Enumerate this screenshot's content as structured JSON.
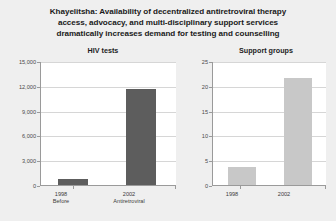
{
  "title": {
    "line1": "Khayelitsha: Availability of decentralized antiretroviral therapy",
    "line2": "access, advocacy, and multi-disciplinary support services",
    "line3": "dramatically increases demand for testing and counselling"
  },
  "colors": {
    "background": "#efefef",
    "plot_background": "#ffffff",
    "gridline": "#d6d6d6",
    "axis": "#9a9a9a",
    "bar_dark": "#5d5d5d",
    "bar_light": "#c8c8c8",
    "text": "#1a1a1a"
  },
  "chart_data": [
    {
      "type": "bar",
      "title": "HIV tests",
      "xlabel": "",
      "ylabel": "",
      "categories": [
        "1998",
        "2002"
      ],
      "category_sublabels": [
        "Before",
        "Antiretroviral"
      ],
      "values": [
        800,
        11700
      ],
      "ylim": [
        0,
        15000
      ],
      "yticks": [
        0,
        3000,
        6000,
        9000,
        12000,
        15000
      ],
      "ytick_labels": [
        "0",
        "3,000",
        "6,000",
        "9,000",
        "12,000",
        "15,000"
      ],
      "grid": true,
      "legend": "none",
      "bar_color": "#5d5d5d"
    },
    {
      "type": "bar",
      "title": "Support groups",
      "xlabel": "",
      "ylabel": "",
      "categories": [
        "1998",
        "2002"
      ],
      "category_sublabels": [
        "",
        ""
      ],
      "values": [
        3.8,
        21.7
      ],
      "ylim": [
        0,
        25
      ],
      "yticks": [
        0,
        5,
        10,
        15,
        20,
        25
      ],
      "ytick_labels": [
        "0",
        "5",
        "10",
        "15",
        "20",
        "25"
      ],
      "grid": true,
      "legend": "none",
      "bar_color": "#c8c8c8"
    }
  ]
}
